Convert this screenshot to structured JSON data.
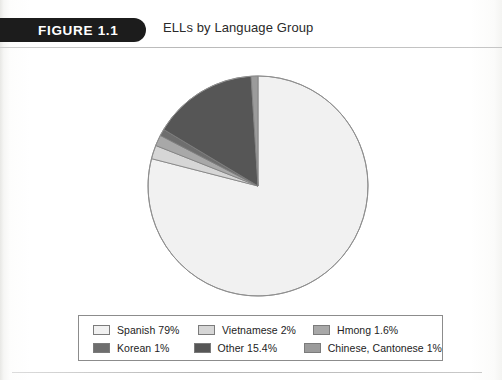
{
  "header": {
    "figure_banner_label": "FIGURE 1.1",
    "title": "ELLs by Language Group"
  },
  "chart_data": {
    "type": "pie",
    "title": "ELLs by Language Group",
    "xlabel": "",
    "ylabel": "",
    "legend_position": "bottom",
    "start_angle_deg": 90,
    "direction": "counterclockwise",
    "categories": [
      "Spanish",
      "Vietnamese",
      "Hmong",
      "Korean",
      "Other",
      "Chinese, Cantonese"
    ],
    "values": [
      79,
      2,
      1.6,
      1,
      15.4,
      1
    ],
    "value_labels": [
      "79%",
      "2%",
      "1.6%",
      "1%",
      "15.4%",
      "1%"
    ],
    "colors": [
      "#f1f1f1",
      "#d6d6d6",
      "#a8a8a8",
      "#6e6e6e",
      "#565656",
      "#9b9b9b"
    ],
    "slices": [
      {
        "label": "Spanish",
        "value": 79,
        "value_label": "79%",
        "color": "#f1f1f1"
      },
      {
        "label": "Vietnamese",
        "value": 2,
        "value_label": "2%",
        "color": "#d6d6d6"
      },
      {
        "label": "Hmong",
        "value": 1.6,
        "value_label": "1.6%",
        "color": "#a8a8a8"
      },
      {
        "label": "Korean",
        "value": 1,
        "value_label": "1%",
        "color": "#6e6e6e"
      },
      {
        "label": "Other",
        "value": 15.4,
        "value_label": "15.4%",
        "color": "#565656"
      },
      {
        "label": "Chinese, Cantonese",
        "value": 1,
        "value_label": "1%",
        "color": "#9b9b9b"
      }
    ]
  },
  "legend": {
    "rows": [
      [
        {
          "label": "Spanish 79%",
          "color": "#f1f1f1"
        },
        {
          "label": "Vietnamese 2%",
          "color": "#d6d6d6"
        },
        {
          "label": "Hmong 1.6%",
          "color": "#a8a8a8"
        }
      ],
      [
        {
          "label": "Korean 1%",
          "color": "#6e6e6e"
        },
        {
          "label": "Other 15.4%",
          "color": "#565656"
        },
        {
          "label": "Chinese, Cantonese 1%",
          "color": "#9b9b9b"
        }
      ]
    ]
  }
}
